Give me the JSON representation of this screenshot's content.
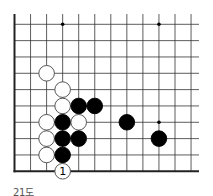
{
  "diagram": {
    "caption": "21도",
    "board": {
      "cols": 12,
      "rows": 10,
      "origin_x": 14.5,
      "origin_y": 24.3,
      "spacing_x": 16.05,
      "spacing_y": 16.33,
      "right_extent": 199,
      "top_extent": 14,
      "edges": [
        "left",
        "bottom"
      ],
      "line_color": "#333333",
      "border_color": "#222222",
      "star_points": [
        {
          "col": 3,
          "row": 0
        },
        {
          "col": 9,
          "row": 0
        },
        {
          "col": 9,
          "row": 6
        }
      ]
    },
    "stones": [
      {
        "color": "white",
        "col": 2,
        "row": 3
      },
      {
        "color": "white",
        "col": 3,
        "row": 4
      },
      {
        "color": "white",
        "col": 3,
        "row": 5
      },
      {
        "color": "black",
        "col": 4,
        "row": 5
      },
      {
        "color": "black",
        "col": 5,
        "row": 5
      },
      {
        "color": "white",
        "col": 2,
        "row": 6
      },
      {
        "color": "black",
        "col": 3,
        "row": 6
      },
      {
        "color": "white",
        "col": 4,
        "row": 6
      },
      {
        "color": "black",
        "col": 7,
        "row": 6
      },
      {
        "color": "white",
        "col": 2,
        "row": 7
      },
      {
        "color": "black",
        "col": 3,
        "row": 7
      },
      {
        "color": "black",
        "col": 4,
        "row": 7
      },
      {
        "color": "black",
        "col": 9,
        "row": 7
      },
      {
        "color": "white",
        "col": 2,
        "row": 8
      },
      {
        "color": "black",
        "col": 3,
        "row": 8
      },
      {
        "color": "white",
        "col": 3,
        "row": 9,
        "label": "1"
      }
    ],
    "colors": {
      "black_stone": "#000000",
      "white_stone": "#ffffff",
      "stone_outline": "#444444",
      "caption": "#555555"
    }
  }
}
